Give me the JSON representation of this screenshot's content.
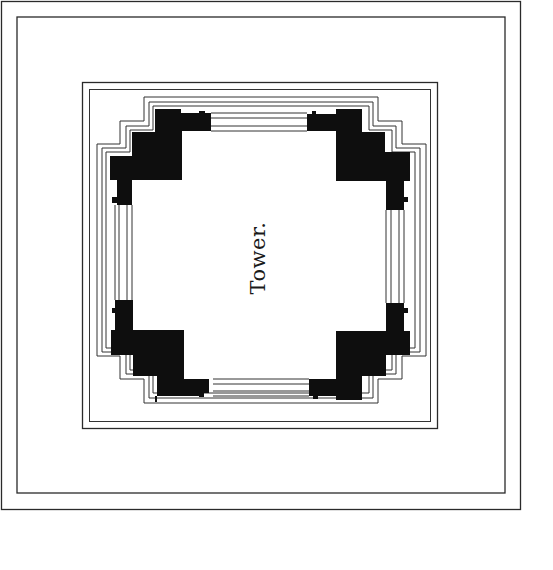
{
  "figure": {
    "type": "architectural floor plan",
    "label": "Tower.",
    "colors": {
      "ink": "#0e0e0e",
      "line": "#2a2a2a",
      "paper": "#ffffff"
    }
  }
}
